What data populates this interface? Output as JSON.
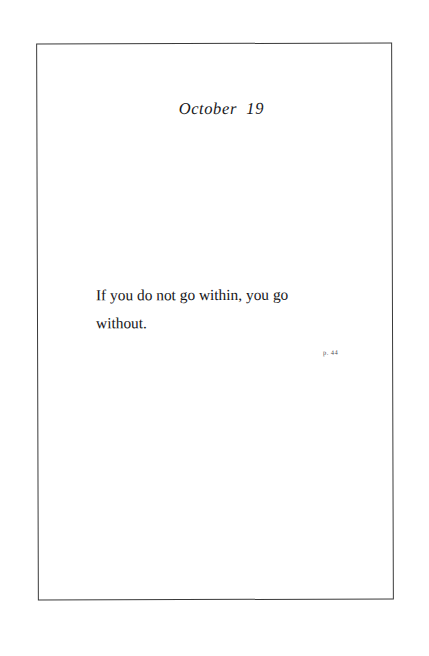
{
  "page": {
    "date_heading": "October  19",
    "quote": "If you do not go within, you go without.",
    "citation": "p. 44"
  }
}
